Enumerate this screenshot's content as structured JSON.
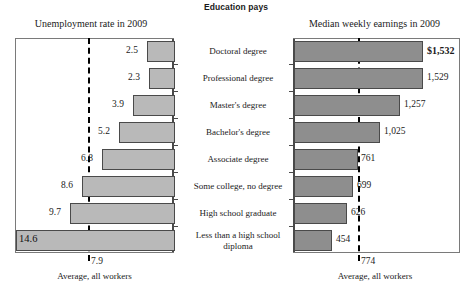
{
  "title": "Education pays",
  "left": {
    "title": "Unemployment rate in 2009",
    "average_label": "Average, all workers",
    "average_value": "7.9",
    "values": [
      "2.5",
      "2.3",
      "3.9",
      "5.2",
      "6.8",
      "8.6",
      "9.7",
      "14.6"
    ]
  },
  "right": {
    "title": "Median weekly earnings in 2009",
    "average_label": "Average, all workers",
    "average_value": "774",
    "values": [
      "$1,532",
      "1,529",
      "1,257",
      "1,025",
      "761",
      "699",
      "626",
      "454"
    ]
  },
  "categories": [
    "Doctoral degree",
    "Professional degree",
    "Master's degree",
    "Bachelor's degree",
    "Associate degree",
    "Some college, no degree",
    "High school graduate",
    "Less than a high\nschool diploma"
  ],
  "colors": {
    "bar_fill_left": "#b9b9b9",
    "bar_fill_right": "#8e8e8e",
    "bar_stroke": "#4a4a4a",
    "axis": "#4a4a4a",
    "box": "#7a7a7a",
    "average_line": "#000000"
  },
  "chart_data": [
    {
      "type": "bar",
      "orientation": "horizontal-right-to-left",
      "title": "Unemployment rate in 2009",
      "xlabel": "Unemployment rate (%)",
      "ylabel": "",
      "categories": [
        "Doctoral degree",
        "Professional degree",
        "Master's degree",
        "Bachelor's degree",
        "Associate degree",
        "Some college, no degree",
        "High school graduate",
        "Less than a high school diploma"
      ],
      "values": [
        2.5,
        2.3,
        3.9,
        5.2,
        6.8,
        8.6,
        9.7,
        14.6
      ],
      "xlim": [
        0,
        14.6
      ],
      "grid": false,
      "legend": "none",
      "annotations": [
        {
          "type": "reference-line",
          "label": "Average, all workers",
          "value": 7.9,
          "style": "dashed"
        }
      ]
    },
    {
      "type": "bar",
      "orientation": "horizontal-left-to-right",
      "title": "Median weekly earnings in 2009",
      "xlabel": "Median weekly earnings ($)",
      "ylabel": "",
      "categories": [
        "Doctoral degree",
        "Professional degree",
        "Master's degree",
        "Bachelor's degree",
        "Associate degree",
        "Some college, no degree",
        "High school graduate",
        "Less than a high school diploma"
      ],
      "values": [
        1532,
        1529,
        1257,
        1025,
        761,
        699,
        626,
        454
      ],
      "xlim": [
        0,
        1532
      ],
      "grid": false,
      "legend": "none",
      "annotations": [
        {
          "type": "reference-line",
          "label": "Average, all workers",
          "value": 774,
          "style": "dashed"
        }
      ]
    }
  ]
}
